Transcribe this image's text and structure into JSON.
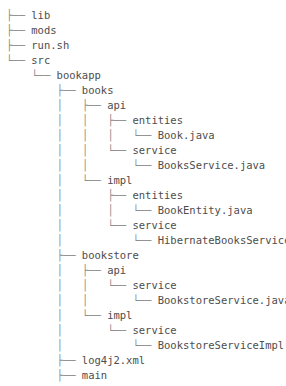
{
  "tree": {
    "title": "directory-tree",
    "colors": {
      "background": "#ffffff",
      "text": "#4d4d4d",
      "branch": "#8c8c8c"
    },
    "glyphs": {
      "tee": "├── ",
      "elbow": "└── ",
      "pipe": "│   ",
      "blank": "    "
    },
    "rows": [
      {
        "prefix": "├── ",
        "label": "lib"
      },
      {
        "prefix": "├── ",
        "label": "mods"
      },
      {
        "prefix": "├── ",
        "label": "run.sh"
      },
      {
        "prefix": "└── ",
        "label": "src"
      },
      {
        "prefix": "    └── ",
        "label": "bookapp"
      },
      {
        "prefix": "        ├── ",
        "label": "books"
      },
      {
        "prefix": "        │   ├── ",
        "label": "api"
      },
      {
        "prefix": "        │   │   ├── ",
        "label": "entities"
      },
      {
        "prefix": "        │   │   │   └── ",
        "label": "Book.java"
      },
      {
        "prefix": "        │   │   └── ",
        "label": "service"
      },
      {
        "prefix": "        │   │       └── ",
        "label": "BooksService.java"
      },
      {
        "prefix": "        │   └── ",
        "label": "impl"
      },
      {
        "prefix": "        │       ├── ",
        "label": "entities"
      },
      {
        "prefix": "        │       │   └── ",
        "label": "BookEntity.java"
      },
      {
        "prefix": "        │       └── ",
        "label": "service"
      },
      {
        "prefix": "        │           └── ",
        "label": "HibernateBooksService.java"
      },
      {
        "prefix": "        ├── ",
        "label": "bookstore"
      },
      {
        "prefix": "        │   ├── ",
        "label": "api"
      },
      {
        "prefix": "        │   │   └── ",
        "label": "service"
      },
      {
        "prefix": "        │   │       └── ",
        "label": "BookstoreService.java"
      },
      {
        "prefix": "        │   └── ",
        "label": "impl"
      },
      {
        "prefix": "        │       └── ",
        "label": "service"
      },
      {
        "prefix": "        │           └── ",
        "label": "BookstoreServiceImpl.java"
      },
      {
        "prefix": "        ├── ",
        "label": "log4j2.xml"
      },
      {
        "prefix": "        ├── ",
        "label": "main"
      }
    ]
  }
}
